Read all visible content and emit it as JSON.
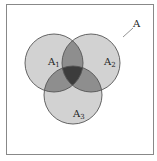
{
  "diagram": {
    "type": "venn",
    "universe_label": "A",
    "sets": [
      {
        "name": "A",
        "sub": "1"
      },
      {
        "name": "A",
        "sub": "2"
      },
      {
        "name": "A",
        "sub": "3"
      }
    ],
    "colors": {
      "single": "#d2d2d2",
      "pair": "#8e8e8e",
      "triple": "#3c3c3c",
      "stroke": "#555555",
      "frame": "#888888"
    }
  }
}
